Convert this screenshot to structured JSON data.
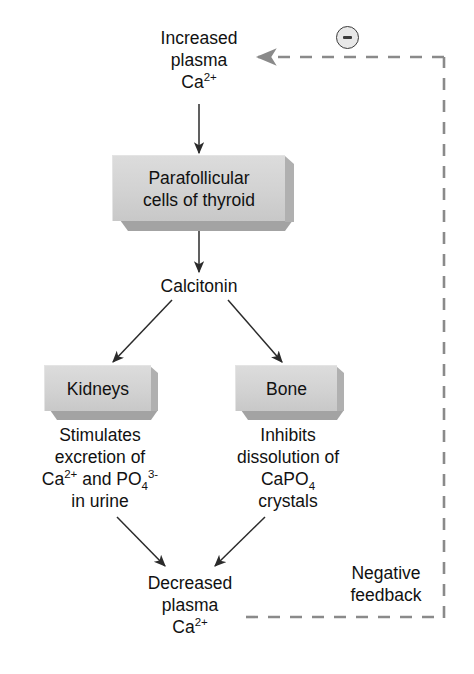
{
  "diagram": {
    "background_color": "#ffffff",
    "box_fill_color": "#d2d2d2",
    "box_shadow_color": "#a3a3a3",
    "line_color": "#2b2b2b",
    "dashed_line_color": "#7a7a7a",
    "nodes": {
      "increased_plasma": {
        "line1": "Increased",
        "line2": "plasma",
        "line3_base": "Ca",
        "line3_sup": "2+"
      },
      "parafollicular_box": {
        "line1": "Parafollicular",
        "line2": "cells of thyroid"
      },
      "calcitonin": {
        "label": "Calcitonin"
      },
      "kidneys_box": {
        "label": "Kidneys"
      },
      "bone_box": {
        "label": "Bone"
      },
      "kidney_effect": {
        "line1": "Stimulates",
        "line2": "excretion of",
        "line3_a": "Ca",
        "line3_a_sup": "2+",
        "line3_b": " and PO",
        "line3_b_sub": "4",
        "line3_b_sup": "3-",
        "line4": "in urine"
      },
      "bone_effect": {
        "line1": "Inhibits",
        "line2": "dissolution of",
        "line3_base": "CaPO",
        "line3_sub": "4",
        "line4": "crystals"
      },
      "decreased_plasma": {
        "line1": "Decreased",
        "line2": "plasma",
        "line3_base": "Ca",
        "line3_sup": "2+"
      },
      "negative_feedback": {
        "line1": "Negative",
        "line2": "feedback"
      },
      "minus_badge": {
        "symbol": "−",
        "meaning": "inhibition"
      }
    },
    "caption_cut_off": ""
  }
}
